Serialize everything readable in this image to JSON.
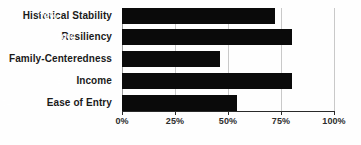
{
  "chart_data": {
    "type": "bar",
    "orientation": "horizontal",
    "title": "",
    "subtitle": "",
    "xlabel": "",
    "ylabel": "",
    "categories": [
      "Historical Stability",
      "Resiliency",
      "Family-Centeredness",
      "Income",
      "Ease of Entry"
    ],
    "values": [
      72,
      80,
      46,
      80,
      54
    ],
    "value_labels": [
      "72%",
      "80%",
      "46%",
      "80%",
      "54%"
    ],
    "xlim": [
      0,
      100
    ],
    "xticks": [
      0,
      25,
      50,
      75,
      100
    ],
    "xtick_labels": [
      "0%",
      "25%",
      "50%",
      "75%",
      "100%"
    ],
    "grid": true,
    "grid_axis": "x",
    "legend": false,
    "legend_position": "none",
    "bar_color": "#0a0a0a",
    "value_label_color": "#ffffff",
    "gridline_color": "#c9c9c9",
    "background_color": "#fefefe"
  },
  "axis": {
    "x_tick_0": "0%",
    "x_tick_1": "25%",
    "x_tick_2": "50%",
    "x_tick_3": "75%",
    "x_tick_4": "100%"
  },
  "bars": [
    {
      "category": "Historical Stability",
      "value": 72,
      "label": "72%"
    },
    {
      "category": "Resiliency",
      "value": 80,
      "label": "80%"
    },
    {
      "category": "Family-Centeredness",
      "value": 46,
      "label": "46%"
    },
    {
      "category": "Income",
      "value": 80,
      "label": "80%"
    },
    {
      "category": "Ease of Entry",
      "value": 54,
      "label": "54%"
    }
  ]
}
